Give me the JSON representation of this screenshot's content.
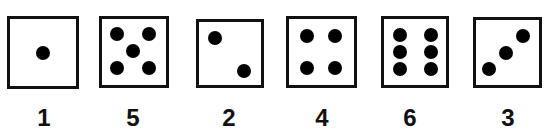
{
  "dice": [
    {
      "label": "1",
      "value": 1
    },
    {
      "label": "5",
      "value": 5
    },
    {
      "label": "2",
      "value": 2
    },
    {
      "label": "4",
      "value": 4
    },
    {
      "label": "6",
      "value": 6
    },
    {
      "label": "3",
      "value": 3
    }
  ],
  "colors": {
    "border": "#111111",
    "pip": "#000000",
    "background": "#ffffff"
  }
}
